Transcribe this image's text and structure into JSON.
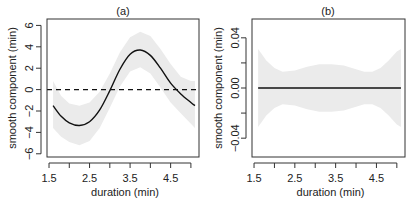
{
  "chart_data": [
    {
      "type": "line",
      "title": "(a)",
      "xlabel": "duration (min)",
      "ylabel": "smooth component (min)",
      "xlim": [
        1.45,
        5.2
      ],
      "ylim": [
        -6.3,
        6.6
      ],
      "xticks": [
        1.5,
        2.0,
        2.5,
        3.0,
        3.5,
        4.0,
        4.5,
        5.0
      ],
      "xtick_labels": [
        "1.5",
        "",
        "2.5",
        "",
        "3.5",
        "",
        "4.5",
        ""
      ],
      "yticks": [
        -6,
        -4,
        -2,
        0,
        2,
        4,
        6
      ],
      "ytick_labels": [
        "-6",
        "-4",
        "-2",
        "0",
        "2",
        "4",
        "6"
      ],
      "reference_line": {
        "y": 0,
        "style": "dashed"
      },
      "grid": false,
      "series": [
        {
          "name": "smooth estimate",
          "x": [
            1.6,
            1.8,
            2.0,
            2.25,
            2.5,
            2.75,
            3.0,
            3.25,
            3.5,
            3.75,
            4.0,
            4.25,
            4.5,
            4.75,
            5.0,
            5.1
          ],
          "y": [
            -1.5,
            -2.5,
            -3.1,
            -3.35,
            -3.0,
            -1.9,
            -0.1,
            1.9,
            3.3,
            3.7,
            3.2,
            2.0,
            0.6,
            -0.4,
            -1.2,
            -1.5
          ]
        }
      ],
      "band": {
        "name": "confidence band",
        "upper": [
          0.8,
          -0.6,
          -1.3,
          -1.5,
          -1.2,
          -0.2,
          1.5,
          3.5,
          4.9,
          5.4,
          5.0,
          3.8,
          2.4,
          1.2,
          0.8,
          0.8
        ],
        "lower": [
          -3.6,
          -4.4,
          -4.9,
          -5.2,
          -4.8,
          -3.6,
          -1.7,
          0.3,
          1.7,
          2.1,
          1.5,
          0.2,
          -1.2,
          -2.2,
          -3.2,
          -3.6
        ]
      }
    },
    {
      "type": "line",
      "title": "(b)",
      "xlabel": "duration (min)",
      "ylabel": "smooth component (min)",
      "xlim": [
        1.45,
        5.2
      ],
      "ylim": [
        -0.055,
        0.055
      ],
      "xticks": [
        1.5,
        2.0,
        2.5,
        3.0,
        3.5,
        4.0,
        4.5,
        5.0
      ],
      "xtick_labels": [
        "1.5",
        "",
        "2.5",
        "",
        "3.5",
        "",
        "4.5",
        ""
      ],
      "yticks": [
        -0.04,
        -0.02,
        0.0,
        0.02,
        0.04
      ],
      "ytick_labels": [
        "-0.04",
        "",
        "0.00",
        "",
        "0.04"
      ],
      "grid": false,
      "series": [
        {
          "name": "smooth estimate",
          "x": [
            1.6,
            5.1
          ],
          "y": [
            0.0,
            0.0
          ]
        }
      ],
      "band": {
        "name": "confidence band",
        "x": [
          1.6,
          1.8,
          2.0,
          2.2,
          2.5,
          2.8,
          3.1,
          3.4,
          3.7,
          4.0,
          4.2,
          4.4,
          4.6,
          4.8,
          5.0,
          5.1
        ],
        "upper": [
          0.031,
          0.022,
          0.016,
          0.013,
          0.014,
          0.017,
          0.019,
          0.019,
          0.018,
          0.015,
          0.013,
          0.013,
          0.016,
          0.022,
          0.029,
          0.031
        ],
        "lower": [
          -0.031,
          -0.022,
          -0.016,
          -0.013,
          -0.014,
          -0.017,
          -0.019,
          -0.019,
          -0.018,
          -0.015,
          -0.013,
          -0.013,
          -0.016,
          -0.022,
          -0.029,
          -0.031
        ]
      }
    }
  ],
  "colors": {
    "line": "#111111",
    "band": "#ebebeb",
    "axis": "#333333",
    "text": "#222222"
  }
}
